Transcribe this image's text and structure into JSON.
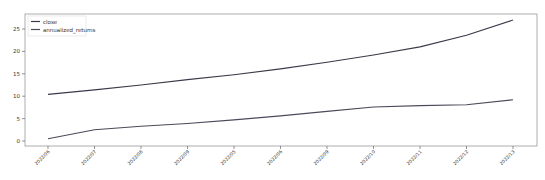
{
  "chart_data": {
    "type": "line",
    "title": "",
    "xlabel": "",
    "ylabel": "",
    "x": [
      "2022/06",
      "2022/07",
      "2022/08",
      "2022/09",
      "2022/05",
      "2022/06",
      "2022/09",
      "2022/10",
      "2022/11",
      "2022/12",
      "2022/13"
    ],
    "series": [
      {
        "name": "close",
        "color": "#3a3a4a",
        "values": [
          10.4,
          11.4,
          12.5,
          13.7,
          14.8,
          16.1,
          17.6,
          19.2,
          21.0,
          23.6,
          27.0
        ]
      },
      {
        "name": "annualized_returns",
        "color": "#4a4a5a",
        "values": [
          0.5,
          2.5,
          3.3,
          3.9,
          4.7,
          5.6,
          6.6,
          7.6,
          7.9,
          8.1,
          9.2
        ]
      }
    ],
    "yticks": [
      0,
      5,
      10,
      15,
      20,
      25
    ],
    "ylim": [
      -0.8,
      28.3
    ],
    "grid": false,
    "legend_position": "upper left"
  }
}
